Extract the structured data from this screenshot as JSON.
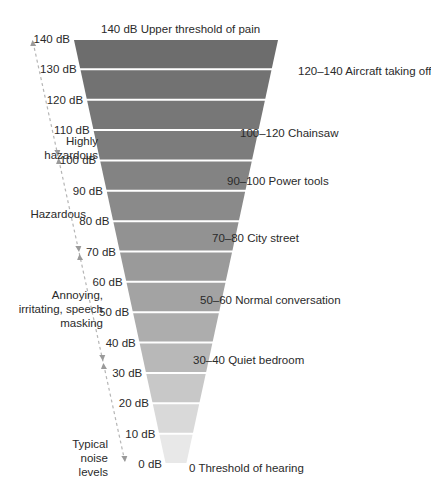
{
  "title_top": "140 dB Upper threshold of pain",
  "bottom_label": "0 Threshold of hearing",
  "chart_data": {
    "type": "funnel",
    "levels_db": [
      140,
      130,
      120,
      110,
      100,
      90,
      80,
      70,
      60,
      50,
      40,
      30,
      20,
      10,
      0
    ],
    "level_labels": [
      "140 dB",
      "130 dB",
      "120 dB",
      "110 dB",
      "100 dB",
      "90 dB",
      "80 dB",
      "70 dB",
      "60 dB",
      "50 dB",
      "40 dB",
      "30 dB",
      "20 dB",
      "10 dB",
      "0 dB"
    ],
    "band_colors": [
      "#6d6d6d",
      "#727272",
      "#777777",
      "#7c7c7c",
      "#838383",
      "#8a8a8a",
      "#929292",
      "#9a9a9a",
      "#a3a3a3",
      "#adadad",
      "#b8b8b8",
      "#c8c8c8",
      "#d9d9d9",
      "#e8e8e8"
    ],
    "examples": [
      {
        "range": "140",
        "label": "140 dB Upper threshold of pain"
      },
      {
        "range": "120–140",
        "label": "120–140 Aircraft taking off"
      },
      {
        "range": "100–120",
        "label": "100–120 Chainsaw"
      },
      {
        "range": "90–100",
        "label": "90–100 Power tools"
      },
      {
        "range": "70–80",
        "label": "70–80 City street"
      },
      {
        "range": "50–60",
        "label": "50–60 Normal conversation"
      },
      {
        "range": "30–40",
        "label": "30–40 Quiet bedroom"
      },
      {
        "range": "0",
        "label": "0 Threshold of hearing"
      }
    ],
    "categories": [
      {
        "label": "Highly hazardous",
        "from_db": 140,
        "to_db": 100
      },
      {
        "label": "Hazardous",
        "from_db": 100,
        "to_db": 70
      },
      {
        "label": "Annoying, irritating, speech masking",
        "from_db": 70,
        "to_db": 40
      },
      {
        "label": "Typical noise levels",
        "from_db": 40,
        "to_db": 0
      }
    ]
  },
  "examples_right": [
    {
      "text": "120–140 Aircraft taking off",
      "x": 298,
      "y": 65
    },
    {
      "text": "100–120 Chainsaw",
      "x": 240,
      "y": 127
    },
    {
      "text": "90–100 Power tools",
      "x": 227,
      "y": 175
    },
    {
      "text": "70–80 City street",
      "x": 212,
      "y": 232
    },
    {
      "text": "50–60 Normal conversation",
      "x": 200,
      "y": 294
    },
    {
      "text": "30–40 Quiet bedroom",
      "x": 193,
      "y": 354
    }
  ],
  "categories_left": [
    {
      "lines": [
        "Highly",
        "hazardous"
      ],
      "right": 98,
      "y": 134
    },
    {
      "lines": [
        "Hazardous"
      ],
      "right": 86,
      "y": 207
    },
    {
      "lines": [
        "Annoying,",
        "irritating, speech",
        "masking"
      ],
      "right": 103,
      "y": 288
    },
    {
      "lines": [
        "Typical",
        "noise",
        "levels"
      ],
      "right": 108,
      "y": 437
    }
  ]
}
